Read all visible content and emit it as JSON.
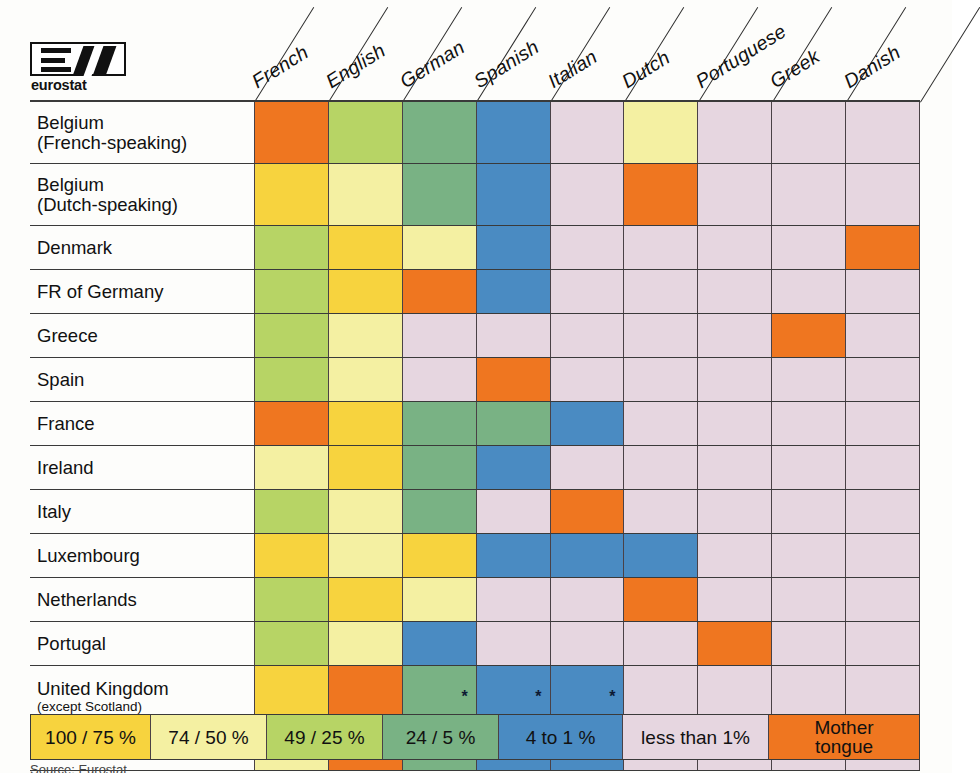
{
  "logo": {
    "name": "eurostat",
    "mark": "E-slash-mark"
  },
  "source_note": "Source: Eurostat",
  "legend": {
    "items": [
      {
        "label": "100 / 75 %",
        "color": "#f7d33e"
      },
      {
        "label": "74 / 50 %",
        "color": "#f4f0a2"
      },
      {
        "label": "49 / 25 %",
        "color": "#b7d465"
      },
      {
        "label": "24 / 5 %",
        "color": "#79b284"
      },
      {
        "label": "4 to 1 %",
        "color": "#4a8bc2"
      },
      {
        "label": "less than 1%",
        "color": "#e6d6e0"
      },
      {
        "label": "Mother tongue",
        "label_line1": "Mother",
        "label_line2": "tongue",
        "color": "#ef7620"
      }
    ]
  },
  "chart_data": {
    "type": "heatmap",
    "xlabel": "Language",
    "ylabel": "Country",
    "legend_position": "bottom",
    "grid": true,
    "columns": [
      "French",
      "English",
      "German",
      "Spanish",
      "Italian",
      "Dutch",
      "Portuguese",
      "Greek",
      "Danish"
    ],
    "rows": [
      {
        "label_line1": "Belgium",
        "label_line2": "(French-speaking)"
      },
      {
        "label_line1": "Belgium",
        "label_line2": "(Dutch-speaking)"
      },
      {
        "label_line1": "Denmark",
        "label_line2": ""
      },
      {
        "label_line1": "FR of Germany",
        "label_line2": ""
      },
      {
        "label_line1": "Greece",
        "label_line2": ""
      },
      {
        "label_line1": "Spain",
        "label_line2": ""
      },
      {
        "label_line1": "France",
        "label_line2": ""
      },
      {
        "label_line1": "Ireland",
        "label_line2": ""
      },
      {
        "label_line1": "Italy",
        "label_line2": ""
      },
      {
        "label_line1": "Luxembourg",
        "label_line2": ""
      },
      {
        "label_line1": "Netherlands",
        "label_line2": ""
      },
      {
        "label_line1": "Portugal",
        "label_line2": ""
      },
      {
        "label_line1": "United Kingdom",
        "label_line2": "(except Scotland)",
        "label_line2_small": true
      },
      {
        "label_line1": "Scotland",
        "label_line2": ""
      }
    ],
    "categories_legend": [
      "100 / 75 %",
      "74 / 50 %",
      "49 / 25 %",
      "24 / 5 %",
      "4 to 1 %",
      "less than 1%",
      "Mother tongue"
    ],
    "category_colors": [
      "#f7d33e",
      "#f4f0a2",
      "#b7d465",
      "#79b284",
      "#4a8bc2",
      "#e6d6e0",
      "#ef7620"
    ],
    "values": [
      [
        "Mother tongue",
        "49 / 25 %",
        "24 / 5 %",
        "4 to 1 %",
        "less than 1%",
        "74 / 50 %",
        "less than 1%",
        "less than 1%",
        "less than 1%"
      ],
      [
        "100 / 75 %",
        "74 / 50 %",
        "24 / 5 %",
        "4 to 1 %",
        "less than 1%",
        "Mother tongue",
        "less than 1%",
        "less than 1%",
        "less than 1%"
      ],
      [
        "49 / 25 %",
        "100 / 75 %",
        "74 / 50 %",
        "4 to 1 %",
        "less than 1%",
        "less than 1%",
        "less than 1%",
        "less than 1%",
        "Mother tongue"
      ],
      [
        "49 / 25 %",
        "100 / 75 %",
        "Mother tongue",
        "4 to 1 %",
        "less than 1%",
        "less than 1%",
        "less than 1%",
        "less than 1%",
        "less than 1%"
      ],
      [
        "49 / 25 %",
        "74 / 50 %",
        "less than 1%",
        "less than 1%",
        "less than 1%",
        "less than 1%",
        "less than 1%",
        "Mother tongue",
        "less than 1%"
      ],
      [
        "49 / 25 %",
        "74 / 50 %",
        "less than 1%",
        "Mother tongue",
        "less than 1%",
        "less than 1%",
        "less than 1%",
        "less than 1%",
        "less than 1%"
      ],
      [
        "Mother tongue",
        "100 / 75 %",
        "24 / 5 %",
        "24 / 5 %",
        "4 to 1 %",
        "less than 1%",
        "less than 1%",
        "less than 1%",
        "less than 1%"
      ],
      [
        "74 / 50 %",
        "100 / 75 %",
        "24 / 5 %",
        "4 to 1 %",
        "less than 1%",
        "less than 1%",
        "less than 1%",
        "less than 1%",
        "less than 1%"
      ],
      [
        "49 / 25 %",
        "74 / 50 %",
        "24 / 5 %",
        "less than 1%",
        "Mother tongue",
        "less than 1%",
        "less than 1%",
        "less than 1%",
        "less than 1%"
      ],
      [
        "100 / 75 %",
        "74 / 50 %",
        "100 / 75 %",
        "4 to 1 %",
        "4 to 1 %",
        "4 to 1 %",
        "less than 1%",
        "less than 1%",
        "less than 1%"
      ],
      [
        "49 / 25 %",
        "100 / 75 %",
        "74 / 50 %",
        "less than 1%",
        "less than 1%",
        "Mother tongue",
        "less than 1%",
        "less than 1%",
        "less than 1%"
      ],
      [
        "49 / 25 %",
        "74 / 50 %",
        "4 to 1 %",
        "less than 1%",
        "less than 1%",
        "less than 1%",
        "Mother tongue",
        "less than 1%",
        "less than 1%"
      ],
      [
        "100 / 75 %",
        "Mother tongue",
        "24 / 5 %",
        "4 to 1 %",
        "4 to 1 %",
        "less than 1%",
        "less than 1%",
        "less than 1%",
        "less than 1%"
      ],
      [
        "74 / 50 %",
        "Mother tongue",
        "24 / 5 %",
        "4 to 1 %",
        "4 to 1 %",
        "less than 1%",
        "less than 1%",
        "less than 1%",
        "less than 1%"
      ]
    ],
    "annotations": [
      {
        "row": "United Kingdom (except Scotland)",
        "column": "German",
        "marker": "*"
      },
      {
        "row": "United Kingdom (except Scotland)",
        "column": "Spanish",
        "marker": "*"
      },
      {
        "row": "United Kingdom (except Scotland)",
        "column": "Italian",
        "marker": "*"
      },
      {
        "row": "Scotland",
        "column": "German",
        "marker": "*"
      },
      {
        "row": "Scotland",
        "column": "Spanish",
        "marker": "*"
      },
      {
        "row": "Scotland",
        "column": "Italian",
        "marker": "*"
      }
    ]
  }
}
